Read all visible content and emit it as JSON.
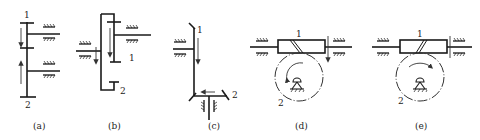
{
  "figure": {
    "type": "mechanism-diagram",
    "panels": [
      {
        "id": "a",
        "caption": "(a)",
        "kind": "spur gears, external mesh (side view)",
        "labels": [
          "1",
          "2"
        ]
      },
      {
        "id": "b",
        "caption": "(b)",
        "kind": "spur gears, internal mesh (side view)",
        "labels": [
          "1",
          "2"
        ]
      },
      {
        "id": "c",
        "caption": "(c)",
        "kind": "bevel gears",
        "labels": [
          "1",
          "2"
        ]
      },
      {
        "id": "d",
        "caption": "(d)",
        "kind": "worm and worm wheel (right-hand worm)",
        "labels": [
          "1",
          "2"
        ]
      },
      {
        "id": "e",
        "caption": "(e)",
        "kind": "worm and worm wheel (left-hand worm)",
        "labels": [
          "1",
          "2"
        ]
      }
    ]
  },
  "colors": {
    "ink": "#1a1a1a",
    "background": "#ffffff"
  }
}
